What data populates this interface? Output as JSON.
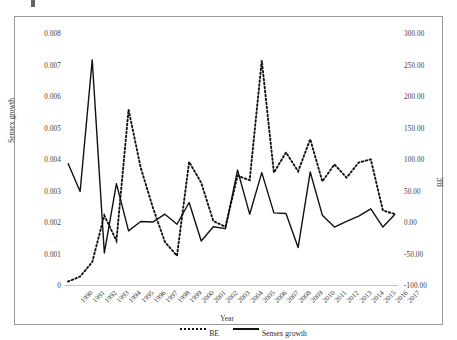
{
  "figure": {
    "top_mark": "",
    "x_axis_title": "Year",
    "y_left_title": "Sensex growth",
    "y_right_title": "BE"
  },
  "legend": {
    "position": "bottom-center",
    "items": [
      {
        "label": "BE",
        "style": "dotted",
        "color": "#111111"
      },
      {
        "label": "Sensex growth",
        "style": "solid",
        "color": "#111111"
      }
    ]
  },
  "chart_data": {
    "type": "line",
    "title": "",
    "subtitle": "",
    "xlabel": "Year",
    "ylabel": "Sensex growth",
    "y2label": "BE",
    "grid": false,
    "legend_position": "bottom-center",
    "categories": [
      "1990",
      "1991",
      "1992",
      "1993",
      "1994",
      "1995",
      "1996",
      "1997",
      "1998",
      "1999",
      "2000",
      "2001",
      "2002",
      "2003",
      "2004",
      "2005",
      "2006",
      "2007",
      "2008",
      "2009",
      "2010",
      "2011",
      "2012",
      "2013",
      "2014",
      "2015",
      "2016",
      "2017"
    ],
    "y_left_ticks": [
      0,
      0.001,
      0.002,
      0.003,
      0.004,
      0.005,
      0.006,
      0.007,
      0.008
    ],
    "y_left_tick_labels": [
      "0",
      "0.001",
      "0.002",
      "0.003",
      "0.004",
      "0.005",
      "0.006",
      "0.007",
      "0.008"
    ],
    "ylim": [
      0,
      0.008
    ],
    "y_right_ticks": [
      -100,
      -50,
      0,
      50,
      100,
      150,
      200,
      250,
      300
    ],
    "y_right_tick_labels": [
      "-100.00",
      "-50.00",
      "0.00",
      "50.00",
      "100.00",
      "150.00",
      "200.00",
      "250.00",
      "300.00"
    ],
    "y2lim": [
      -100,
      300
    ],
    "series": [
      {
        "name": "Sensex growth",
        "axis": "left",
        "style": "solid",
        "color": "#111111",
        "values": [
          0.0039,
          0.003,
          0.00718,
          0.00105,
          0.00325,
          0.00175,
          0.00205,
          0.00203,
          0.00228,
          0.00196,
          0.00265,
          0.00143,
          0.00188,
          0.00182,
          0.00368,
          0.00228,
          0.0036,
          0.00232,
          0.0023,
          0.00122,
          0.00362,
          0.00225,
          0.00187,
          0.00205,
          0.00222,
          0.00245,
          0.00187,
          0.00228
        ]
      },
      {
        "name": "BE",
        "axis": "right",
        "style": "dotted",
        "color": "#111111",
        "values": [
          -93.0,
          -85.0,
          -62.0,
          12.0,
          -28.0,
          180.0,
          88.0,
          25.0,
          -30.0,
          -52.0,
          97.0,
          64.0,
          3.0,
          -6.0,
          75.0,
          68.0,
          258.0,
          80.0,
          112.0,
          82.0,
          133.0,
          66.0,
          93.0,
          72.0,
          96.0,
          101.0,
          20.0,
          14.0
        ]
      }
    ]
  }
}
